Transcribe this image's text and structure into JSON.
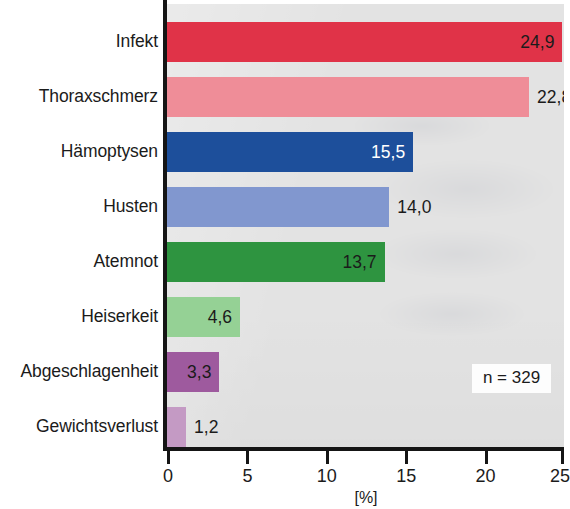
{
  "chart_data": {
    "type": "bar",
    "orientation": "horizontal",
    "title": "",
    "subtitle": "",
    "xlabel": "[%]",
    "ylabel": "",
    "xlim": [
      0,
      25
    ],
    "ylim": null,
    "grid": false,
    "legend": null,
    "annotations": [
      "n = 329"
    ],
    "x_ticks": [
      0,
      5,
      10,
      15,
      20,
      25
    ],
    "x_tick_labels": [
      "0",
      "5",
      "10",
      "15",
      "20",
      "25"
    ],
    "value_label_format": "comma-decimal",
    "categories": [
      "Infekt",
      "Thoraxschmerz",
      "Hämoptysen",
      "Husten",
      "Atemnot",
      "Heiserkeit",
      "Abgeschlagenheit",
      "Gewichtsverlust"
    ],
    "values": [
      24.9,
      22.8,
      15.5,
      14.0,
      13.7,
      4.6,
      3.3,
      1.2
    ],
    "value_labels": [
      "24,9",
      "22,8",
      "15,5",
      "14,0",
      "13,7",
      "4,6",
      "3,3",
      "1,2"
    ],
    "colors": [
      "#e03348",
      "#ef8d98",
      "#1d4f9b",
      "#8197cf",
      "#2e9440",
      "#95d195",
      "#9e5a9e",
      "#c49ac4"
    ],
    "value_label_colors": [
      "#1b1b1b",
      "#1b1b1b",
      "#ffffff",
      "#1b1b1b",
      "#1b1b1b",
      "#1b1b1b",
      "#1b1b1b",
      "#1b1b1b"
    ],
    "value_label_placement": [
      "inside-end",
      "outside-end",
      "inside-end",
      "outside-end",
      "inside-end",
      "inside-end",
      "inside-end",
      "outside-end"
    ],
    "plot_background": "#e3e3e3",
    "axis_color": "#151515",
    "bars": [
      {
        "category": "Infekt",
        "value": 24.9,
        "label": "24,9",
        "color": "#e03348",
        "label_color": "#1b1b1b",
        "placement": "inside-end"
      },
      {
        "category": "Thoraxschmerz",
        "value": 22.8,
        "label": "22,8",
        "color": "#ef8d98",
        "label_color": "#1b1b1b",
        "placement": "outside-end"
      },
      {
        "category": "Hämoptysen",
        "value": 15.5,
        "label": "15,5",
        "color": "#1d4f9b",
        "label_color": "#ffffff",
        "placement": "inside-end"
      },
      {
        "category": "Husten",
        "value": 14.0,
        "label": "14,0",
        "color": "#8197cf",
        "label_color": "#1b1b1b",
        "placement": "outside-end"
      },
      {
        "category": "Atemnot",
        "value": 13.7,
        "label": "13,7",
        "color": "#2e9440",
        "label_color": "#1b1b1b",
        "placement": "inside-end"
      },
      {
        "category": "Heiserkeit",
        "value": 4.6,
        "label": "4,6",
        "color": "#95d195",
        "label_color": "#1b1b1b",
        "placement": "inside-end"
      },
      {
        "category": "Abgeschlagenheit",
        "value": 3.3,
        "label": "3,3",
        "color": "#9e5a9e",
        "label_color": "#1b1b1b",
        "placement": "inside-end"
      },
      {
        "category": "Gewichtsverlust",
        "value": 1.2,
        "label": "1,2",
        "color": "#c49ac4",
        "label_color": "#1b1b1b",
        "placement": "outside-end"
      }
    ]
  },
  "axis": {
    "x_title": "[%]",
    "ticks": [
      "0",
      "5",
      "10",
      "15",
      "20",
      "25"
    ]
  },
  "badge": {
    "sample_size_text": "n = 329"
  }
}
